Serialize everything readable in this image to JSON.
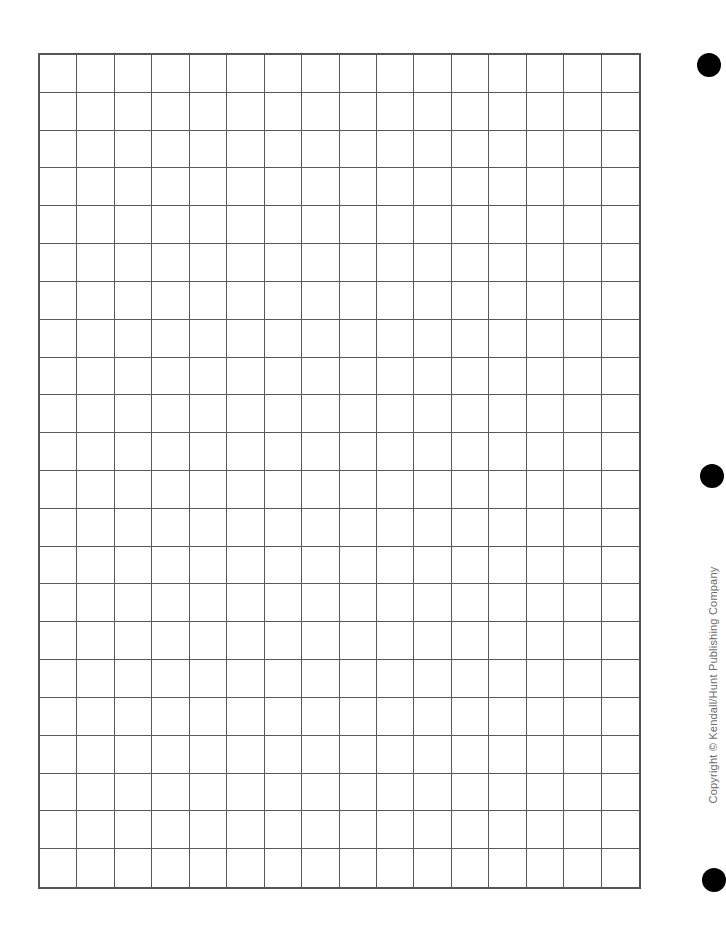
{
  "page": {
    "type": "graph-paper-worksheet",
    "background_color": "#ffffff"
  },
  "grid": {
    "columns": 16,
    "rows": 22,
    "line_color": "#5a5a5a",
    "border_color": "#555555"
  },
  "hole_punches": [
    {
      "position": "top",
      "color": "#000000"
    },
    {
      "position": "middle",
      "color": "#000000"
    },
    {
      "position": "bottom",
      "color": "#000000"
    }
  ],
  "footer": {
    "copyright_text": "Copyright © Kendall/Hunt Publishing Company",
    "text_color": "#6b6b6b"
  }
}
